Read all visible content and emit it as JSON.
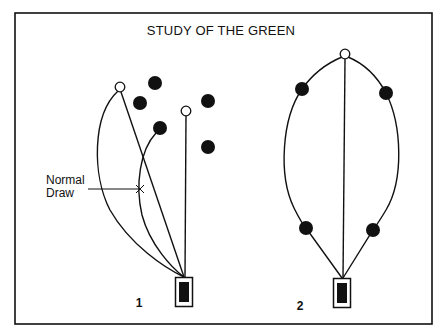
{
  "title": "STUDY OF THE GREEN",
  "annotation": {
    "line1": "Normal",
    "line2": "Draw"
  },
  "diagrams": [
    {
      "label": "1",
      "open_circles": 2,
      "filled_circles": 5,
      "description": "Two open circles (targets) with curved and straight paths from the green box; filled circles are obstacles"
    },
    {
      "label": "2",
      "open_circles": 1,
      "filled_circles": 4,
      "description": "One open circle at top with symmetric curved paths passing around four filled circles and a straight center path"
    }
  ],
  "colors": {
    "ink": "#111111",
    "background": "#ffffff"
  }
}
